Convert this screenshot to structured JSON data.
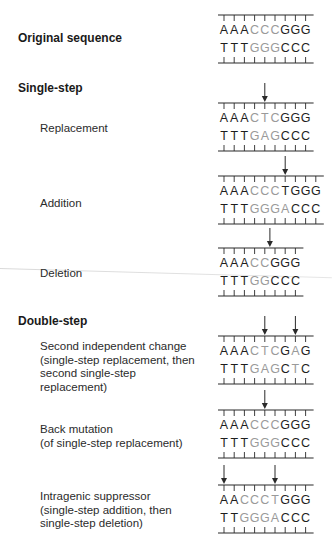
{
  "colors": {
    "normal_base": "#1e1e1e",
    "changed_base": "#9a9a9a",
    "line": "#2a2a2a"
  },
  "sections": {
    "original": {
      "heading": "Original sequence"
    },
    "single_step": {
      "heading": "Single-step"
    },
    "double_step": {
      "heading": "Double-step"
    }
  },
  "labels": {
    "replacement": "Replacement",
    "addition": "Addition",
    "deletion": "Deletion",
    "second_change": [
      "Second independent change",
      "(single-step replacement, then",
      "second single-step",
      "replacement)"
    ],
    "back_mutation": [
      "Back mutation",
      "(of single-step replacement)"
    ],
    "intragenic": [
      "Intragenic suppressor",
      "(single-step addition, then",
      "single-step deletion)"
    ]
  },
  "diagrams": [
    {
      "name": "original",
      "top": [
        [
          "A",
          "n"
        ],
        [
          "A",
          "n"
        ],
        [
          "A",
          "n"
        ],
        [
          "C",
          "c"
        ],
        [
          "C",
          "c"
        ],
        [
          "C",
          "c"
        ],
        [
          "G",
          "n"
        ],
        [
          "G",
          "n"
        ],
        [
          "G",
          "n"
        ]
      ],
      "bottom": [
        [
          "T",
          "n"
        ],
        [
          "T",
          "n"
        ],
        [
          "T",
          "n"
        ],
        [
          "G",
          "c"
        ],
        [
          "G",
          "c"
        ],
        [
          "G",
          "c"
        ],
        [
          "C",
          "n"
        ],
        [
          "C",
          "n"
        ],
        [
          "C",
          "n"
        ]
      ],
      "arrows": []
    },
    {
      "name": "replacement",
      "top": [
        [
          "A",
          "n"
        ],
        [
          "A",
          "n"
        ],
        [
          "A",
          "n"
        ],
        [
          "C",
          "c"
        ],
        [
          "T",
          "c"
        ],
        [
          "C",
          "c"
        ],
        [
          "G",
          "n"
        ],
        [
          "G",
          "n"
        ],
        [
          "G",
          "n"
        ]
      ],
      "bottom": [
        [
          "T",
          "n"
        ],
        [
          "T",
          "n"
        ],
        [
          "T",
          "n"
        ],
        [
          "G",
          "c"
        ],
        [
          "A",
          "c"
        ],
        [
          "G",
          "c"
        ],
        [
          "C",
          "n"
        ],
        [
          "C",
          "n"
        ],
        [
          "C",
          "n"
        ]
      ],
      "arrows": [
        5
      ]
    },
    {
      "name": "addition",
      "top": [
        [
          "A",
          "n"
        ],
        [
          "A",
          "n"
        ],
        [
          "A",
          "n"
        ],
        [
          "C",
          "c"
        ],
        [
          "C",
          "c"
        ],
        [
          "C",
          "c"
        ],
        [
          "T",
          "n"
        ],
        [
          "G",
          "n"
        ],
        [
          "G",
          "n"
        ],
        [
          "G",
          "n"
        ]
      ],
      "bottom": [
        [
          "T",
          "n"
        ],
        [
          "T",
          "n"
        ],
        [
          "T",
          "n"
        ],
        [
          "G",
          "c"
        ],
        [
          "G",
          "c"
        ],
        [
          "G",
          "c"
        ],
        [
          "A",
          "c"
        ],
        [
          "C",
          "n"
        ],
        [
          "C",
          "n"
        ],
        [
          "C",
          "n"
        ]
      ],
      "arrows": [
        7
      ]
    },
    {
      "name": "deletion",
      "top": [
        [
          "A",
          "n"
        ],
        [
          "A",
          "n"
        ],
        [
          "A",
          "n"
        ],
        [
          "C",
          "c"
        ],
        [
          "C",
          "c"
        ],
        [
          "G",
          "n"
        ],
        [
          "G",
          "n"
        ],
        [
          "G",
          "n"
        ]
      ],
      "bottom": [
        [
          "T",
          "n"
        ],
        [
          "T",
          "n"
        ],
        [
          "T",
          "n"
        ],
        [
          "G",
          "c"
        ],
        [
          "G",
          "c"
        ],
        [
          "C",
          "n"
        ],
        [
          "C",
          "n"
        ],
        [
          "C",
          "n"
        ]
      ],
      "arrows": [
        5.5
      ]
    },
    {
      "name": "second-independent-change",
      "top": [
        [
          "A",
          "n"
        ],
        [
          "A",
          "n"
        ],
        [
          "A",
          "n"
        ],
        [
          "C",
          "c"
        ],
        [
          "T",
          "c"
        ],
        [
          "C",
          "c"
        ],
        [
          "G",
          "n"
        ],
        [
          "A",
          "c"
        ],
        [
          "G",
          "n"
        ]
      ],
      "bottom": [
        [
          "T",
          "n"
        ],
        [
          "T",
          "n"
        ],
        [
          "T",
          "n"
        ],
        [
          "G",
          "c"
        ],
        [
          "A",
          "c"
        ],
        [
          "G",
          "c"
        ],
        [
          "C",
          "n"
        ],
        [
          "T",
          "c"
        ],
        [
          "C",
          "n"
        ]
      ],
      "arrows": [
        5,
        8
      ]
    },
    {
      "name": "back-mutation",
      "top": [
        [
          "A",
          "n"
        ],
        [
          "A",
          "n"
        ],
        [
          "A",
          "n"
        ],
        [
          "C",
          "c"
        ],
        [
          "C",
          "c"
        ],
        [
          "C",
          "c"
        ],
        [
          "G",
          "n"
        ],
        [
          "G",
          "n"
        ],
        [
          "G",
          "n"
        ]
      ],
      "bottom": [
        [
          "T",
          "n"
        ],
        [
          "T",
          "n"
        ],
        [
          "T",
          "n"
        ],
        [
          "G",
          "c"
        ],
        [
          "G",
          "c"
        ],
        [
          "G",
          "c"
        ],
        [
          "C",
          "n"
        ],
        [
          "C",
          "n"
        ],
        [
          "C",
          "n"
        ]
      ],
      "arrows": [
        5
      ]
    },
    {
      "name": "intragenic-suppressor",
      "top": [
        [
          "A",
          "n"
        ],
        [
          "A",
          "n"
        ],
        [
          "C",
          "c"
        ],
        [
          "C",
          "c"
        ],
        [
          "C",
          "c"
        ],
        [
          "T",
          "c"
        ],
        [
          "G",
          "n"
        ],
        [
          "G",
          "n"
        ],
        [
          "G",
          "n"
        ]
      ],
      "bottom": [
        [
          "T",
          "n"
        ],
        [
          "T",
          "n"
        ],
        [
          "G",
          "c"
        ],
        [
          "G",
          "c"
        ],
        [
          "G",
          "c"
        ],
        [
          "A",
          "c"
        ],
        [
          "C",
          "n"
        ],
        [
          "C",
          "n"
        ],
        [
          "C",
          "n"
        ]
      ],
      "arrows": [
        1,
        6
      ]
    }
  ]
}
